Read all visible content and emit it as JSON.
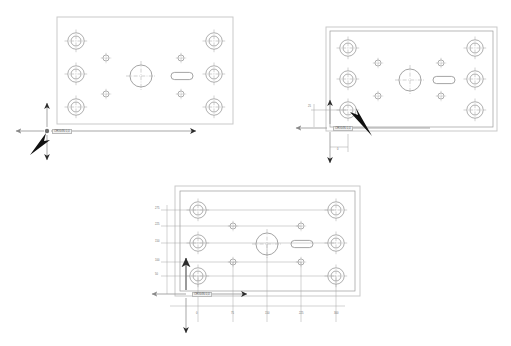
{
  "document": {
    "title": "CAD Drilling Plate Layout",
    "background_color": "#ffffff",
    "width": 511,
    "height": 346
  },
  "palette": {
    "plate_outer_border": "#c9c9c9",
    "plate_inner_border": "#9a9a9a",
    "hole_stroke": "#8d8d8d",
    "centerline": "#a8a8a8",
    "dimension_line": "#9d9d9d",
    "arrow_dark": "#2b2b2b",
    "cursor_black": "#111111",
    "label_text": "#6a6a6a"
  },
  "views": [
    {
      "id": "view-top-left",
      "name": "plate-view-1",
      "origin_marker": {
        "label": "ORIGIN 0,0",
        "x": 47,
        "y": 131
      },
      "cursor": {
        "direction": "up-right",
        "x": 31,
        "y": 152
      },
      "axes": {
        "x_arrow": "right",
        "y_arrow": "down",
        "neg_x_arrow": "left",
        "neg_y_arrow": "up"
      }
    },
    {
      "id": "view-top-right",
      "name": "plate-view-2",
      "origin_marker": {
        "label": "ORIGIN 0,0",
        "x": 330,
        "y": 128
      },
      "cursor": {
        "direction": "up-left",
        "x": 372,
        "y": 133
      },
      "dimensions": [
        {
          "axis": "y",
          "label": "25"
        },
        {
          "axis": "x",
          "label": "0"
        }
      ]
    },
    {
      "id": "view-bottom",
      "name": "plate-view-3",
      "origin_marker": {
        "label": "ORIGIN 0,0",
        "x": 189,
        "y": 294
      },
      "cursor": {
        "direction": "up",
        "x": 186,
        "y": 262
      },
      "y_dimension_labels": [
        "275",
        "225",
        "150",
        "100",
        "50"
      ],
      "x_dimension_labels": [
        "0",
        "75",
        "150",
        "225",
        "300"
      ]
    }
  ],
  "hole_pattern": {
    "description": "Six large counterbored holes at left and right columns, four small holes inboard, one large center bore, one obround slot.",
    "large_holes": [
      {
        "col": "left",
        "row": 1
      },
      {
        "col": "left",
        "row": 2
      },
      {
        "col": "left",
        "row": 3
      },
      {
        "col": "right",
        "row": 1
      },
      {
        "col": "right",
        "row": 2
      },
      {
        "col": "right",
        "row": 3
      }
    ],
    "small_holes": [
      {
        "col": "inner-left",
        "row": "upper"
      },
      {
        "col": "inner-left",
        "row": "lower"
      },
      {
        "col": "inner-right",
        "row": "upper"
      },
      {
        "col": "inner-right",
        "row": "lower"
      }
    ],
    "center_bore": {
      "shape": "circle",
      "label": "center-bore"
    },
    "slot": {
      "shape": "obround",
      "label": "obround-slot"
    }
  }
}
